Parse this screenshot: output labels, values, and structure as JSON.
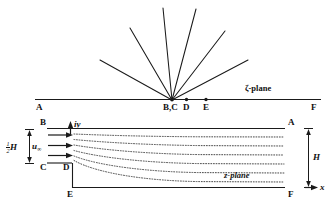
{
  "figure": {
    "zeta_plane": {
      "plane_label": "ζ-plane",
      "point_labels": [
        {
          "name": "A",
          "text": "A"
        },
        {
          "name": "BC",
          "text": "B,C"
        },
        {
          "name": "D",
          "text": "D"
        },
        {
          "name": "E",
          "text": "E"
        },
        {
          "name": "F",
          "text": "F"
        }
      ],
      "ray_count": 6,
      "line_color": "#1a1a1a"
    },
    "z_plane": {
      "plane_label": "z-plane",
      "point_labels": [
        {
          "name": "B",
          "text": "B"
        },
        {
          "name": "A",
          "text": "A"
        },
        {
          "name": "C",
          "text": "C"
        },
        {
          "name": "D",
          "text": "D"
        },
        {
          "name": "E",
          "text": "E"
        },
        {
          "name": "F",
          "text": "F"
        }
      ],
      "axis_labels": {
        "vertical": "iy",
        "horizontal": "x"
      },
      "velocity_label": "u",
      "velocity_subscript": "∞",
      "height_half_numerator": "1",
      "height_half_denominator": "2",
      "height_half_symbol": "H",
      "height_full_symbol": "H",
      "streamline_count": 6,
      "inflow_arrow_count": 3,
      "line_color": "#1a1a1a",
      "streamline_color": "#555555"
    }
  }
}
